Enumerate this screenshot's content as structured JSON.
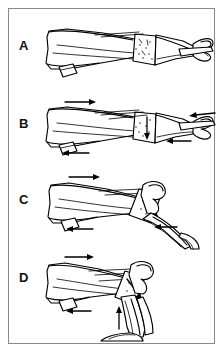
{
  "figure": {
    "kind": "medical-line-illustration",
    "background_color": "#ffffff",
    "line_color": "#000000",
    "border_color": "#8a8a8a",
    "panel_count": 4
  },
  "panels": [
    {
      "label": "A",
      "caption": "",
      "view": "extended limb, lateral view with stippled fracture fragment at mid-shaft",
      "arrows": []
    },
    {
      "label": "B",
      "caption": "",
      "view": "extended limb with traction forces applied",
      "arrows": [
        {
          "name": "proximal-traction-arrow",
          "direction": "right"
        },
        {
          "name": "distal-counter-traction-arrow",
          "direction": "left"
        },
        {
          "name": "lower-proximal-arrow",
          "direction": "left"
        },
        {
          "name": "distal-tip-arrow",
          "direction": "left"
        },
        {
          "name": "fragment-pressure-arrow",
          "direction": "down"
        }
      ]
    },
    {
      "label": "C",
      "caption": "",
      "view": "partially flexed limb during reduction",
      "arrows": [
        {
          "name": "proximal-traction-arrow",
          "direction": "right"
        },
        {
          "name": "fragment-pressure-arrow",
          "direction": "down-right"
        },
        {
          "name": "lower-proximal-arrow",
          "direction": "left"
        },
        {
          "name": "distal-arrow",
          "direction": "left"
        }
      ]
    },
    {
      "label": "D",
      "caption": "",
      "view": "fully flexed limb, reduction complete",
      "arrows": [
        {
          "name": "proximal-traction-arrow",
          "direction": "right"
        },
        {
          "name": "fragment-pressure-arrow",
          "direction": "down-right"
        },
        {
          "name": "lower-proximal-arrow",
          "direction": "left"
        },
        {
          "name": "distal-upward-arrow",
          "direction": "up"
        }
      ]
    }
  ]
}
